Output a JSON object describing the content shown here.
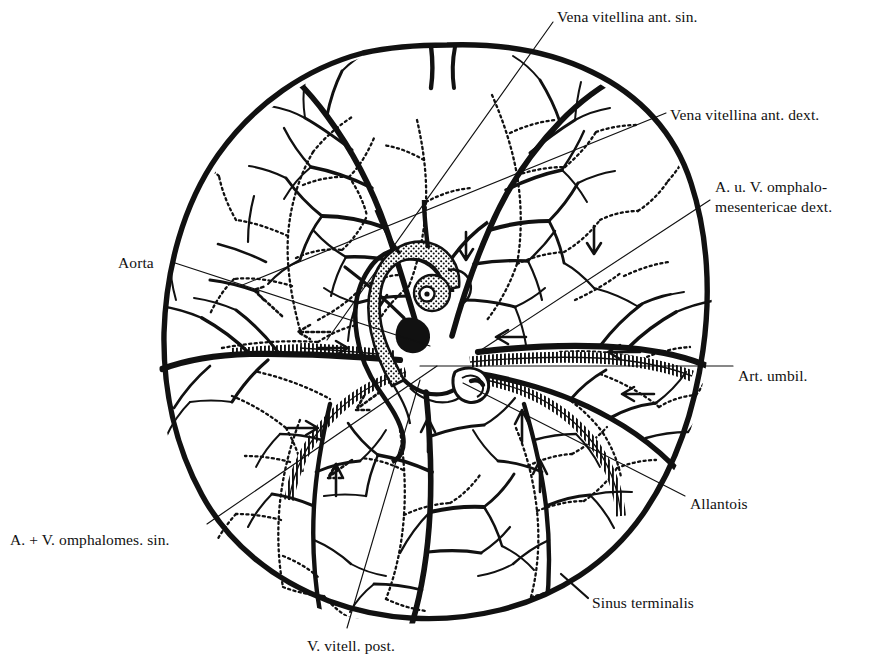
{
  "figure": {
    "kind": "anatomical-illustration",
    "background_color": "#ffffff",
    "ink_color": "#111111"
  },
  "labels": [
    {
      "id": "vena-vitellina-ant-sin",
      "text": "Vena vitellina ant. sin.",
      "x": 557,
      "y": 7,
      "lines": [
        "Vena vitellina ant. sin."
      ]
    },
    {
      "id": "vena-vitellina-ant-dext",
      "text": "Vena vitellina ant. dext.",
      "x": 670,
      "y": 105,
      "lines": [
        "Vena vitellina ant. dext."
      ]
    },
    {
      "id": "a-u-v-omphalomesentericae-dext",
      "text": "A. u. V. omphalo-mesentericae dext.",
      "x": 715,
      "y": 177,
      "lines": [
        "A. u. V. omphalo-",
        "mesentericae dext."
      ]
    },
    {
      "id": "aorta",
      "text": "Aorta",
      "x": 118,
      "y": 253,
      "lines": [
        "Aorta"
      ]
    },
    {
      "id": "art-umbil",
      "text": "Art. umbil.",
      "x": 738,
      "y": 366,
      "lines": [
        "Art. umbil."
      ]
    },
    {
      "id": "allantois",
      "text": "Allantois",
      "x": 690,
      "y": 494,
      "lines": [
        "Allantois"
      ]
    },
    {
      "id": "a-plus-v-omphalomes-sin",
      "text": "A. + V. omphalomes. sin.",
      "x": 10,
      "y": 530,
      "lines": [
        "A. + V. omphalomes. sin."
      ]
    },
    {
      "id": "sinus-terminalis",
      "text": "Sinus terminalis",
      "x": 592,
      "y": 593,
      "lines": [
        "Sinus terminalis"
      ]
    },
    {
      "id": "v-vitell-post",
      "text": "V. vitell. post.",
      "x": 307,
      "y": 636,
      "lines": [
        "V. vitell. post."
      ]
    }
  ],
  "leader_lines": [
    {
      "id": "leader-vena-vitellina-ant-sin",
      "from": [
        553,
        22
      ],
      "to": [
        327,
        340
      ]
    },
    {
      "id": "leader-vena-vitellina-ant-dext",
      "from": [
        666,
        113
      ],
      "to": [
        240,
        286
      ]
    },
    {
      "id": "leader-omphalomesentericae-dext",
      "from": [
        710,
        200
      ],
      "to": [
        478,
        352
      ]
    },
    {
      "id": "leader-aorta",
      "from": [
        172,
        262
      ],
      "to": [
        430,
        346
      ]
    },
    {
      "id": "leader-art-umbil",
      "from": [
        733,
        366
      ],
      "to": [
        420,
        366
      ]
    },
    {
      "id": "leader-allantois",
      "from": [
        685,
        496
      ],
      "to": [
        463,
        383
      ]
    },
    {
      "id": "leader-omphalomes-sin",
      "from": [
        207,
        524
      ],
      "to": [
        437,
        366
      ]
    },
    {
      "id": "leader-sinus-terminalis",
      "from": [
        588,
        598
      ],
      "to": [
        561,
        574
      ]
    },
    {
      "id": "leader-v-vitell-post",
      "from": [
        347,
        628
      ],
      "to": [
        420,
        380
      ]
    }
  ],
  "structures": {
    "yolk_sac_outline": "irregular circle, sinus terminalis border",
    "embryo": "C-curved embryo, stippled body, head upper-left, tail curled under",
    "allantois_vesicle": "small looped vesicle below embryo tail",
    "veins": "thick solid black vessels",
    "arteries": "fine dotted vessels",
    "sinus_vessels": "hatched / comb-textured trunks",
    "flow_arrows": 14
  }
}
